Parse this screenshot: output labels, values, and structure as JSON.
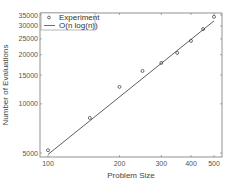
{
  "chart_data": {
    "type": "scatter",
    "title": "",
    "xlabel": "Problem Size",
    "ylabel": "Number of Evaluations",
    "xscale": "log",
    "yscale": "log",
    "xlim": [
      95,
      530
    ],
    "ylim": [
      4900,
      36000
    ],
    "x_ticks": [
      100,
      200,
      300,
      400,
      500
    ],
    "x_tick_labels": [
      "100",
      "200",
      "300",
      "400",
      "500"
    ],
    "y_ticks": [
      5000,
      10000,
      15000,
      20000,
      25000,
      30000,
      35000
    ],
    "y_tick_labels": [
      "5000",
      "10000",
      "15000",
      "20000",
      "25000",
      "30000",
      "35000"
    ],
    "grid": false,
    "legend_position": "upper left",
    "series": [
      {
        "name": "Experiment",
        "style": "markers",
        "marker": "circle-open",
        "x": [
          100,
          150,
          200,
          250,
          300,
          350,
          400,
          450,
          500
        ],
        "y": [
          5200,
          8200,
          12700,
          15900,
          17800,
          20500,
          24300,
          28700,
          34100
        ]
      },
      {
        "name": "O(n log(n))",
        "style": "line",
        "x": [
          100,
          500
        ],
        "y": [
          4900,
          32200
        ]
      }
    ]
  },
  "legend": {
    "items": [
      {
        "label": "Experiment",
        "symbol": "circle-open"
      },
      {
        "label": "O(n log(n))",
        "symbol": "line"
      }
    ]
  },
  "colors": {
    "axis": "#555555",
    "line": "#333333",
    "marker": "#333333",
    "background": "#ffffff"
  }
}
